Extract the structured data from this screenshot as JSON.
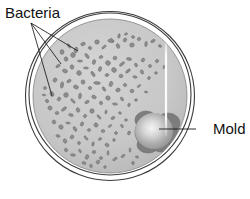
{
  "figure": {
    "background_color": "#ffffff"
  },
  "dish": {
    "name": "petri-dish",
    "center_x": 110,
    "center_y": 96,
    "radius_outer": 85,
    "radius_rim": 80,
    "radius_agar": 77,
    "agar_color": "#c9c9c9",
    "rim_color": "#3a3a3a",
    "agar_edge_color": "#9a9a9a"
  },
  "highlight": {
    "name": "specular-highlight",
    "color": "#ffffff",
    "x": 166,
    "y_top": 38,
    "y_bottom": 136
  },
  "labels": {
    "bacteria": {
      "text": "Bacteria",
      "x": 5,
      "y": 18,
      "fan_origin_x": 31,
      "fan_origin_y": 23,
      "leader_targets": [
        {
          "x": 78,
          "y": 51
        },
        {
          "x": 61,
          "y": 64
        },
        {
          "x": 52,
          "y": 96
        }
      ]
    },
    "mold": {
      "text": "Mold",
      "x": 213,
      "y": 134,
      "leader_from_x": 196,
      "leader_from_y": 129,
      "leader_to_x": 159,
      "leader_to_y": 129
    }
  },
  "mold_colony": {
    "name": "mold-colony",
    "center_x": 158,
    "center_y": 131,
    "core_color": "#f2f2f2",
    "body_color": "#a8a8a8",
    "edge_color": "#7d7d7d",
    "lobes": [
      {
        "cx": 153,
        "cy": 132,
        "rx": 18,
        "ry": 17
      },
      {
        "cx": 168,
        "cy": 123,
        "rx": 12,
        "ry": 10
      },
      {
        "cx": 170,
        "cy": 136,
        "rx": 10,
        "ry": 9
      },
      {
        "cx": 146,
        "cy": 120,
        "rx": 11,
        "ry": 9
      },
      {
        "cx": 148,
        "cy": 145,
        "rx": 11,
        "ry": 8
      },
      {
        "cx": 161,
        "cy": 145,
        "rx": 9,
        "ry": 7
      }
    ]
  },
  "bacteria_colonies": {
    "name": "bacteria-colonies",
    "count": 126,
    "fill_color": "#8d8d8d",
    "stroke_color": "#6a6a6a",
    "points": [
      [
        62,
        52,
        2.6
      ],
      [
        69,
        46,
        2.2
      ],
      [
        76,
        50,
        2.8
      ],
      [
        83,
        44,
        2.4
      ],
      [
        90,
        48,
        2.0
      ],
      [
        97,
        42,
        2.6
      ],
      [
        104,
        47,
        2.2
      ],
      [
        111,
        41,
        2.8
      ],
      [
        118,
        46,
        2.4
      ],
      [
        125,
        40,
        2.2
      ],
      [
        132,
        45,
        2.6
      ],
      [
        139,
        39,
        2.0
      ],
      [
        146,
        44,
        2.4
      ],
      [
        153,
        41,
        2.2
      ],
      [
        160,
        46,
        1.8
      ],
      [
        66,
        59,
        2.4
      ],
      [
        73,
        55,
        2.8
      ],
      [
        80,
        61,
        2.2
      ],
      [
        87,
        56,
        2.6
      ],
      [
        94,
        62,
        2.4
      ],
      [
        101,
        57,
        2.0
      ],
      [
        108,
        63,
        2.8
      ],
      [
        115,
        58,
        2.2
      ],
      [
        122,
        64,
        2.6
      ],
      [
        129,
        59,
        2.4
      ],
      [
        136,
        65,
        2.0
      ],
      [
        143,
        60,
        2.2
      ],
      [
        150,
        66,
        1.8
      ],
      [
        157,
        61,
        2.0
      ],
      [
        164,
        67,
        1.6
      ],
      [
        58,
        66,
        2.2
      ],
      [
        65,
        71,
        2.6
      ],
      [
        72,
        67,
        2.4
      ],
      [
        79,
        73,
        2.8
      ],
      [
        86,
        68,
        2.2
      ],
      [
        93,
        74,
        2.6
      ],
      [
        100,
        69,
        2.4
      ],
      [
        107,
        75,
        2.0
      ],
      [
        114,
        70,
        2.8
      ],
      [
        121,
        76,
        2.2
      ],
      [
        128,
        71,
        2.4
      ],
      [
        135,
        77,
        2.0
      ],
      [
        142,
        72,
        2.2
      ],
      [
        149,
        78,
        1.8
      ],
      [
        156,
        73,
        1.6
      ],
      [
        55,
        80,
        2.4
      ],
      [
        62,
        85,
        2.8
      ],
      [
        69,
        81,
        2.2
      ],
      [
        76,
        87,
        2.6
      ],
      [
        83,
        82,
        2.4
      ],
      [
        90,
        88,
        2.0
      ],
      [
        97,
        83,
        2.8
      ],
      [
        104,
        89,
        2.2
      ],
      [
        111,
        84,
        2.6
      ],
      [
        118,
        90,
        2.4
      ],
      [
        125,
        85,
        2.0
      ],
      [
        132,
        91,
        2.2
      ],
      [
        139,
        86,
        1.8
      ],
      [
        146,
        92,
        1.6
      ],
      [
        52,
        94,
        2.6
      ],
      [
        59,
        99,
        2.2
      ],
      [
        66,
        95,
        2.8
      ],
      [
        73,
        101,
        2.4
      ],
      [
        80,
        96,
        2.6
      ],
      [
        87,
        102,
        2.2
      ],
      [
        94,
        97,
        2.4
      ],
      [
        101,
        103,
        2.0
      ],
      [
        108,
        98,
        2.6
      ],
      [
        115,
        104,
        2.2
      ],
      [
        122,
        99,
        2.0
      ],
      [
        129,
        105,
        1.8
      ],
      [
        136,
        100,
        1.6
      ],
      [
        50,
        108,
        2.4
      ],
      [
        57,
        113,
        2.0
      ],
      [
        64,
        109,
        2.6
      ],
      [
        71,
        115,
        2.2
      ],
      [
        78,
        110,
        2.4
      ],
      [
        85,
        116,
        2.0
      ],
      [
        92,
        111,
        2.6
      ],
      [
        99,
        117,
        2.2
      ],
      [
        106,
        112,
        1.8
      ],
      [
        113,
        118,
        2.0
      ],
      [
        120,
        113,
        1.6
      ],
      [
        54,
        122,
        2.2
      ],
      [
        61,
        127,
        2.6
      ],
      [
        68,
        123,
        2.0
      ],
      [
        75,
        129,
        2.4
      ],
      [
        82,
        124,
        2.2
      ],
      [
        89,
        130,
        1.8
      ],
      [
        96,
        125,
        2.4
      ],
      [
        103,
        131,
        2.0
      ],
      [
        110,
        126,
        1.8
      ],
      [
        58,
        136,
        2.0
      ],
      [
        65,
        141,
        2.4
      ],
      [
        72,
        137,
        2.2
      ],
      [
        79,
        143,
        1.8
      ],
      [
        86,
        138,
        2.2
      ],
      [
        93,
        144,
        2.0
      ],
      [
        100,
        139,
        1.8
      ],
      [
        107,
        145,
        2.2
      ],
      [
        114,
        140,
        1.6
      ],
      [
        66,
        150,
        2.0
      ],
      [
        73,
        155,
        2.2
      ],
      [
        80,
        151,
        1.8
      ],
      [
        87,
        157,
        2.4
      ],
      [
        94,
        152,
        2.0
      ],
      [
        101,
        158,
        1.8
      ],
      [
        108,
        153,
        2.0
      ],
      [
        115,
        159,
        2.2
      ],
      [
        84,
        163,
        2.0
      ],
      [
        91,
        166,
        1.8
      ],
      [
        98,
        162,
        2.2
      ],
      [
        105,
        167,
        1.6
      ],
      [
        112,
        40,
        1.8
      ],
      [
        119,
        36,
        2.0
      ],
      [
        126,
        34,
        1.6
      ],
      [
        133,
        37,
        1.8
      ],
      [
        45,
        88,
        1.8
      ],
      [
        47,
        101,
        2.0
      ],
      [
        44,
        95,
        1.6
      ],
      [
        122,
        126,
        1.8
      ],
      [
        129,
        133,
        2.0
      ],
      [
        126,
        120,
        1.6
      ],
      [
        116,
        133,
        1.8
      ],
      [
        130,
        150,
        1.8
      ],
      [
        123,
        156,
        2.0
      ],
      [
        137,
        157,
        1.6
      ],
      [
        133,
        163,
        1.8
      ]
    ]
  }
}
